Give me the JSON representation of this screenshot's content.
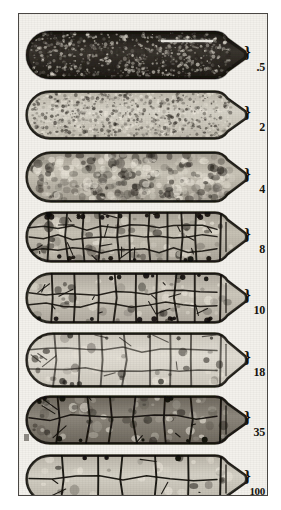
{
  "figure": {
    "kind": "micrograph-plate",
    "panel_count": 8,
    "frame_color": "#4a4744",
    "plate_background": "#f3f1ec",
    "ink_color": "#17150f",
    "scalebar": {
      "present": true,
      "panel": 1,
      "color": "#e8e6df"
    }
  },
  "panels": [
    {
      "label": ".5",
      "brace": "}",
      "tone": "very-dark",
      "description": "uniform fine dark speckled fill, no visible cells",
      "fill_start": "#3a352f",
      "fill_end": "#1b1813",
      "cell_count": 0,
      "cell_stroke_opacity": 0.0,
      "speckle_opacity": 0.85,
      "speckle_scale": "fine"
    },
    {
      "label": "2",
      "brace": "}",
      "tone": "light-speckled",
      "description": "bright granular interior with dark outline rim",
      "fill_start": "#d7d3c8",
      "fill_end": "#bdb8ab",
      "cell_count": 0,
      "cell_stroke_opacity": 0.0,
      "speckle_opacity": 0.7,
      "speckle_scale": "fine"
    },
    {
      "label": "4",
      "brace": "}",
      "tone": "mid-granular",
      "description": "coarse bubble texture, cells beginning to resolve",
      "fill_start": "#cac5b8",
      "fill_end": "#a49e92",
      "cell_count": 0,
      "cell_stroke_opacity": 0.0,
      "speckle_opacity": 0.78,
      "speckle_scale": "coarse"
    },
    {
      "label": "8",
      "brace": "}",
      "tone": "polygonal",
      "description": "clear polygonal foam cells with dark plateau borders",
      "fill_start": "#c7c2b5",
      "fill_end": "#aaa498",
      "cell_count": 34,
      "cell_stroke_opacity": 0.9,
      "speckle_opacity": 0.22,
      "speckle_scale": "coarse"
    },
    {
      "label": "10",
      "brace": "}",
      "tone": "polygonal",
      "description": "fewer, larger polygonal cells; strong horizontal rails",
      "fill_start": "#cdc8bc",
      "fill_end": "#b1aba0",
      "cell_count": 26,
      "cell_stroke_opacity": 0.9,
      "speckle_opacity": 0.16,
      "speckle_scale": "coarse"
    },
    {
      "label": "18",
      "brace": "}",
      "tone": "pale",
      "description": "pale washed-out interior, coarse cells, thin borders",
      "fill_start": "#e2ded4",
      "fill_end": "#cdc8bd",
      "cell_count": 18,
      "cell_stroke_opacity": 0.62,
      "speckle_opacity": 0.1,
      "speckle_scale": "coarse"
    },
    {
      "label": "35",
      "brace": "}",
      "tone": "dark-coarse",
      "description": "dark interior, large coarse cells, heavy outline",
      "fill_start": "#8e887d",
      "fill_end": "#6d675d",
      "cell_count": 14,
      "cell_stroke_opacity": 0.95,
      "speckle_opacity": 0.18,
      "speckle_scale": "coarse"
    },
    {
      "label": "100",
      "brace": "}",
      "tone": "light-coarse",
      "description": "few very large cells, clean bold borders",
      "fill_start": "#d5d1c6",
      "fill_end": "#bab5a9",
      "cell_count": 10,
      "cell_stroke_opacity": 0.95,
      "speckle_opacity": 0.08,
      "speckle_scale": "coarse"
    }
  ]
}
